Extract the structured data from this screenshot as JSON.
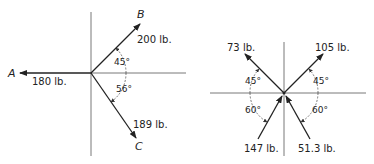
{
  "diagrams": [
    {
      "id": "left",
      "vectors": [
        {
          "name": "A",
          "magnitude_label": "180 lb.",
          "direction": "left"
        },
        {
          "name": "B",
          "magnitude_label": "200 lb.",
          "direction": "45° above +x"
        },
        {
          "name": "C",
          "magnitude_label": "189 lb.",
          "direction": "56° below +x"
        }
      ],
      "angles": [
        "45°",
        "56°"
      ]
    },
    {
      "id": "right",
      "vectors": [
        {
          "magnitude_label": "73 lb.",
          "direction": "45° above -x"
        },
        {
          "magnitude_label": "105 lb.",
          "direction": "45° above +x"
        },
        {
          "magnitude_label": "147 lb.",
          "direction": "60° below -x, pointing to origin"
        },
        {
          "magnitude_label": "51.3 lb.",
          "direction": "60° below +x, pointing to origin"
        }
      ],
      "angles": [
        "45°",
        "45°",
        "60°",
        "60°"
      ]
    }
  ]
}
